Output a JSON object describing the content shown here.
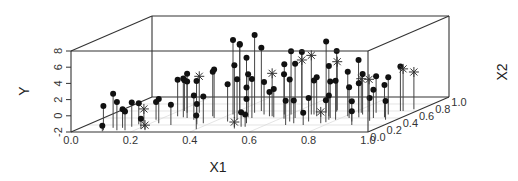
{
  "chart_data": {
    "type": "scatter3d",
    "title": "",
    "xlabel": "X1",
    "ylabel": "X2",
    "zlabel": "Y",
    "x1_ticks": [
      "0.0",
      "0.2",
      "0.4",
      "0.6",
      "0.8",
      "1.0"
    ],
    "x2_ticks": [
      "0.0",
      "0.2",
      "0.4",
      "0.6",
      "0.8",
      "1.0"
    ],
    "y_ticks": [
      "-2",
      "0",
      "2",
      "4",
      "6",
      "8"
    ],
    "x1_range": [
      0,
      1
    ],
    "x2_range": [
      0,
      1
    ],
    "y_range": [
      -2,
      8
    ],
    "grid": true,
    "drop_lines": true,
    "marker_legend": {
      "dot": "observation (filled circle)",
      "star": "observation (asterisk)"
    },
    "series": [
      {
        "name": "dot",
        "marker": "dot",
        "points": [
          [
            0.21,
            0.05,
            1.0
          ],
          [
            0.22,
            0.02,
            -1.3
          ],
          [
            0.24,
            0.12,
            2.2
          ],
          [
            0.31,
            0.05,
            1.5
          ],
          [
            0.31,
            0.12,
            0.3
          ],
          [
            0.37,
            0.05,
            0.3
          ],
          [
            0.36,
            0.15,
            1.0
          ],
          [
            0.37,
            0.22,
            0.6
          ],
          [
            0.47,
            0.08,
            -0.7
          ],
          [
            0.5,
            0.25,
            1.0
          ],
          [
            0.52,
            0.45,
            2.5
          ],
          [
            0.53,
            0.55,
            2.8
          ],
          [
            0.48,
            0.6,
            1.8
          ],
          [
            0.42,
            0.35,
            0.2
          ],
          [
            0.58,
            0.42,
            2.8
          ],
          [
            0.62,
            0.2,
            0.5
          ],
          [
            0.62,
            0.4,
            2.5
          ],
          [
            0.7,
            0.35,
            1.0
          ],
          [
            0.75,
            0.3,
            3.0
          ],
          [
            0.8,
            0.22,
            0.5
          ],
          [
            0.78,
            0.45,
            3.5
          ],
          [
            0.83,
            0.25,
            1.3
          ],
          [
            0.82,
            0.4,
            4.0
          ],
          [
            0.88,
            0.08,
            -0.3
          ],
          [
            0.9,
            0.5,
            7.2
          ],
          [
            0.92,
            0.55,
            6.5
          ],
          [
            0.95,
            0.5,
            6.6
          ],
          [
            0.97,
            0.4,
            4.5
          ],
          [
            1.0,
            0.5,
            5.0
          ],
          [
            1.03,
            0.55,
            7.6
          ],
          [
            1.05,
            0.6,
            5.8
          ],
          [
            1.02,
            0.35,
            3.0
          ],
          [
            0.98,
            0.3,
            2.6
          ],
          [
            1.06,
            0.42,
            3.3
          ],
          [
            1.1,
            0.4,
            2.8
          ],
          [
            1.12,
            0.3,
            2.2
          ],
          [
            1.15,
            0.25,
            1.0
          ],
          [
            1.13,
            0.5,
            2.0
          ],
          [
            1.17,
            0.15,
            -0.2
          ],
          [
            1.2,
            0.15,
            -0.5
          ],
          [
            1.2,
            0.45,
            1.0
          ],
          [
            1.25,
            0.42,
            1.5
          ],
          [
            1.28,
            0.5,
            4.2
          ],
          [
            1.33,
            0.5,
            5.8
          ],
          [
            1.38,
            0.55,
            5.5
          ],
          [
            1.35,
            0.38,
            3.5
          ],
          [
            1.42,
            0.4,
            4.7
          ],
          [
            1.44,
            0.3,
            3.2
          ],
          [
            1.47,
            0.2,
            1.0
          ],
          [
            1.5,
            0.25,
            0.8
          ],
          [
            1.5,
            0.5,
            2.2
          ],
          [
            1.55,
            0.45,
            2.8
          ],
          [
            1.58,
            0.3,
            0.9
          ],
          [
            1.6,
            0.2,
            -0.5
          ],
          [
            1.56,
            0.55,
            6.8
          ],
          [
            1.62,
            0.58,
            5.5
          ],
          [
            1.64,
            0.45,
            4.2
          ],
          [
            1.68,
            0.4,
            2.5
          ],
          [
            1.7,
            0.35,
            1.0
          ],
          [
            1.72,
            0.28,
            0.7
          ],
          [
            1.75,
            0.35,
            2.8
          ],
          [
            1.78,
            0.45,
            3.5
          ],
          [
            1.8,
            0.55,
            4.5
          ],
          [
            1.82,
            0.4,
            1.8
          ],
          [
            1.86,
            0.5,
            3.0
          ],
          [
            1.88,
            0.42,
            2.2
          ],
          [
            1.9,
            0.3,
            0.5
          ],
          [
            1.93,
            0.55,
            2.5
          ],
          [
            1.96,
            0.2,
            -0.3
          ],
          [
            2.0,
            0.4,
            1.5
          ],
          [
            2.02,
            0.32,
            0.8
          ],
          [
            2.05,
            0.5,
            2.6
          ],
          [
            2.07,
            0.42,
            2.0
          ],
          [
            2.08,
            0.6,
            3.5
          ],
          [
            2.12,
            0.35,
            0.3
          ]
        ]
      },
      {
        "name": "star",
        "marker": "star",
        "points": [
          [
            0.45,
            0.15,
            0.2
          ],
          [
            0.5,
            0.08,
            -1.5
          ],
          [
            0.62,
            0.55,
            2.5
          ],
          [
            1.15,
            0.1,
            -1.2
          ],
          [
            1.22,
            0.45,
            3.3
          ],
          [
            1.35,
            0.6,
            4.3
          ],
          [
            1.48,
            0.5,
            5.3
          ],
          [
            1.6,
            0.62,
            4.0
          ],
          [
            1.7,
            0.25,
            -0.6
          ],
          [
            1.82,
            0.55,
            2.2
          ],
          [
            1.86,
            0.58,
            2.0
          ],
          [
            2.1,
            0.6,
            3.2
          ],
          [
            2.15,
            0.65,
            2.6
          ]
        ]
      }
    ],
    "note": "x1 values above 1.0 here are layout coordinates along the visible projection; values approximate positions as read from the figure"
  }
}
